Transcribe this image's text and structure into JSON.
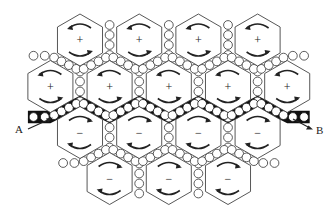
{
  "diagram": {
    "rows": [
      {
        "row": 1,
        "cells": [
          {
            "sign": "+"
          },
          {
            "sign": "+"
          },
          {
            "sign": "+"
          },
          {
            "sign": "+"
          }
        ]
      },
      {
        "row": 2,
        "cells": [
          {
            "sign": "+"
          },
          {
            "sign": "+"
          },
          {
            "sign": "+"
          },
          {
            "sign": "+"
          },
          {
            "sign": "+"
          }
        ]
      },
      {
        "row": 3,
        "cells": [
          {
            "sign": "−"
          },
          {
            "sign": "−"
          },
          {
            "sign": "−"
          },
          {
            "sign": "−"
          }
        ]
      },
      {
        "row": 4,
        "cells": [
          {
            "sign": "−"
          },
          {
            "sign": "−"
          },
          {
            "sign": "−"
          }
        ]
      }
    ],
    "labels": {
      "start": "A",
      "end": "B"
    },
    "colors": {
      "stroke": "#333333",
      "band": "#111111",
      "background": "#ffffff"
    }
  }
}
